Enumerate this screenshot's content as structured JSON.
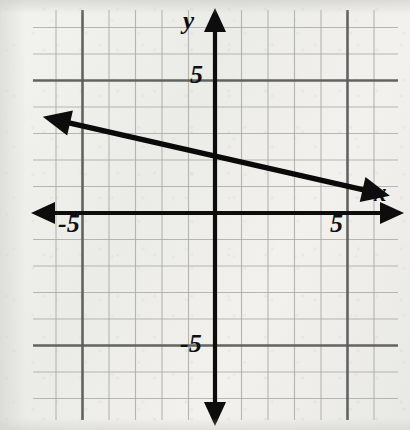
{
  "chart_data": {
    "type": "line",
    "title": "",
    "xlabel": "x",
    "ylabel": "y",
    "xlim": [
      -7,
      7
    ],
    "ylim": [
      -8,
      8
    ],
    "grid": true,
    "grid_step": 1,
    "major_grid_step": 5,
    "legend": "none",
    "x_tick_labels": [
      {
        "value": -5,
        "text": "-5"
      },
      {
        "value": 5,
        "text": "5"
      }
    ],
    "y_tick_labels": [
      {
        "value": 5,
        "text": "5"
      },
      {
        "value": -5,
        "text": "-5"
      }
    ],
    "series": [
      {
        "name": "line",
        "equation": "y = -0.25x + 2",
        "slope": -0.25,
        "intercept": 2,
        "arrows": "both",
        "points": [
          {
            "x": -6.5,
            "y": 3.63
          },
          {
            "x": 6.6,
            "y": 0.65
          }
        ]
      }
    ]
  },
  "labels": {
    "y_axis": "y",
    "x_axis": "x",
    "y_positive_tick": "5",
    "y_negative_tick": "-5",
    "x_negative_tick": "-5",
    "x_positive_tick": "5"
  },
  "colors": {
    "background": "#efefec",
    "grid_minor": "#a8a8a4",
    "grid_major": "#5c5c5a",
    "axis": "#0d0d0d",
    "line": "#0a0a0a"
  },
  "geometry": {
    "origin_x": 215,
    "origin_y": 213,
    "unit_px": 26.5,
    "grid_left": 33,
    "grid_right": 398,
    "grid_top": 10,
    "grid_bottom": 420
  }
}
